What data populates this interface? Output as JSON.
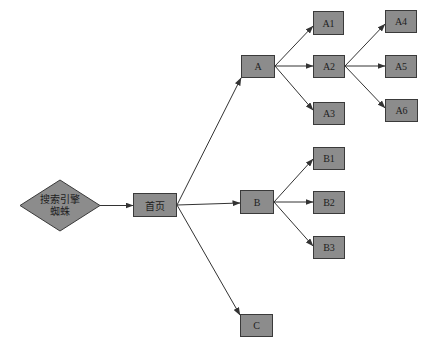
{
  "diagram": {
    "type": "flow-tree",
    "colors": {
      "node_fill": "#8c8c8c",
      "node_border": "#3a3a3a",
      "edge": "#333333",
      "background": "#ffffff"
    },
    "start": {
      "id": "spider",
      "shape": "diamond",
      "line1": "搜索引擎",
      "line2": "蜘蛛"
    },
    "nodes": [
      {
        "id": "home",
        "label": "首页"
      },
      {
        "id": "A",
        "label": "A"
      },
      {
        "id": "B",
        "label": "B"
      },
      {
        "id": "C",
        "label": "C"
      },
      {
        "id": "A1",
        "label": "A1"
      },
      {
        "id": "A2",
        "label": "A2"
      },
      {
        "id": "A3",
        "label": "A3"
      },
      {
        "id": "A4",
        "label": "A4"
      },
      {
        "id": "A5",
        "label": "A5"
      },
      {
        "id": "A6",
        "label": "A6"
      },
      {
        "id": "B1",
        "label": "B1"
      },
      {
        "id": "B2",
        "label": "B2"
      },
      {
        "id": "B3",
        "label": "B3"
      }
    ],
    "edges": [
      [
        "spider",
        "home"
      ],
      [
        "home",
        "A"
      ],
      [
        "home",
        "B"
      ],
      [
        "home",
        "C"
      ],
      [
        "A",
        "A1"
      ],
      [
        "A",
        "A2"
      ],
      [
        "A",
        "A3"
      ],
      [
        "A2",
        "A4"
      ],
      [
        "A2",
        "A5"
      ],
      [
        "A2",
        "A6"
      ],
      [
        "B",
        "B1"
      ],
      [
        "B",
        "B2"
      ],
      [
        "B",
        "B3"
      ]
    ]
  }
}
